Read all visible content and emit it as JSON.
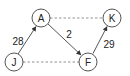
{
  "diagram": {
    "type": "graph",
    "nodes": [
      {
        "id": "A",
        "label": "A",
        "x": 41,
        "y": 18
      },
      {
        "id": "K",
        "label": "K",
        "x": 112,
        "y": 18
      },
      {
        "id": "J",
        "label": "J",
        "x": 14,
        "y": 62
      },
      {
        "id": "F",
        "label": "F",
        "x": 88,
        "y": 62
      }
    ],
    "edges": [
      {
        "from": "J",
        "to": "A",
        "style": "solid",
        "directed": true,
        "weight": "28"
      },
      {
        "from": "A",
        "to": "F",
        "style": "solid",
        "directed": true,
        "weight": "2"
      },
      {
        "from": "F",
        "to": "K",
        "style": "solid",
        "directed": true,
        "weight": "29"
      },
      {
        "from": "A",
        "to": "K",
        "style": "dashed",
        "directed": false,
        "weight": ""
      },
      {
        "from": "J",
        "to": "F",
        "style": "dashed",
        "directed": false,
        "weight": ""
      }
    ],
    "colors": {
      "stroke": "#555555",
      "text": "#222222",
      "background": "#ffffff"
    }
  }
}
